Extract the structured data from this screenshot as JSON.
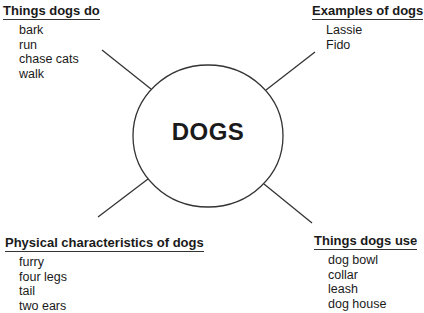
{
  "center": {
    "label": "DOGS"
  },
  "branches": [
    {
      "id": "top-left",
      "heading": "Things dogs do",
      "items": [
        "bark",
        "run",
        "chase cats",
        "walk"
      ]
    },
    {
      "id": "top-right",
      "heading": "Examples of dogs",
      "items": [
        "Lassie",
        "Fido"
      ]
    },
    {
      "id": "bottom-left",
      "heading": "Physical characteristics of dogs",
      "items": [
        "furry",
        "four legs",
        "tail",
        "two ears"
      ]
    },
    {
      "id": "bottom-right",
      "heading": "Things dogs use",
      "items": [
        "dog bowl",
        "collar",
        "leash",
        "dog house"
      ]
    }
  ]
}
